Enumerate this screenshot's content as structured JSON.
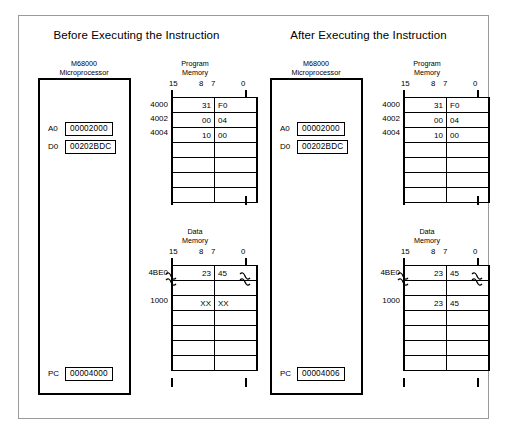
{
  "figure": {
    "bit_header": {
      "msb": "15",
      "bit8": "8",
      "bit7": "7",
      "lsb": "0"
    },
    "cpu_caption_line1": "M68000",
    "cpu_caption_line2": "Microprocessor",
    "program_memory_caption_line1": "Program",
    "program_memory_caption_line2": "Memory",
    "data_memory_caption_line1": "Data",
    "data_memory_caption_line2": "Memory"
  },
  "panels": [
    {
      "title": "Before Executing the Instruction",
      "registers": [
        {
          "name": "A0",
          "value": "00002000"
        },
        {
          "name": "D0",
          "value": "00202BDC"
        }
      ],
      "pc": {
        "name": "PC",
        "value": "00004000"
      },
      "program_memory": {
        "rows": [
          {
            "address": "4000",
            "high": "31",
            "low": "F0"
          },
          {
            "address": "4002",
            "high": "00",
            "low": "04"
          },
          {
            "address": "4004",
            "high": "10",
            "low": "00"
          },
          {
            "address": "",
            "high": "",
            "low": ""
          },
          {
            "address": "",
            "high": "",
            "low": ""
          },
          {
            "address": "",
            "high": "",
            "low": ""
          },
          {
            "address": "",
            "high": "",
            "low": ""
          }
        ]
      },
      "data_memory": {
        "rows": [
          {
            "address": "4BE0",
            "high": "23",
            "low": "45",
            "break_after": true
          },
          {
            "address": "1000",
            "high": "XX",
            "low": "XX",
            "break_after": false
          },
          {
            "address": "",
            "high": "",
            "low": "",
            "break_after": false
          },
          {
            "address": "",
            "high": "",
            "low": "",
            "break_after": false
          },
          {
            "address": "",
            "high": "",
            "low": "",
            "break_after": false
          },
          {
            "address": "",
            "high": "",
            "low": "",
            "break_after": false
          },
          {
            "address": "",
            "high": "",
            "low": "",
            "break_after": false
          }
        ]
      }
    },
    {
      "title": "After Executing the Instruction",
      "registers": [
        {
          "name": "A0",
          "value": "00002000"
        },
        {
          "name": "D0",
          "value": "00202BDC"
        }
      ],
      "pc": {
        "name": "PC",
        "value": "00004006"
      },
      "program_memory": {
        "rows": [
          {
            "address": "4000",
            "high": "31",
            "low": "F0"
          },
          {
            "address": "4002",
            "high": "00",
            "low": "04"
          },
          {
            "address": "4004",
            "high": "10",
            "low": "00"
          },
          {
            "address": "",
            "high": "",
            "low": ""
          },
          {
            "address": "",
            "high": "",
            "low": ""
          },
          {
            "address": "",
            "high": "",
            "low": ""
          },
          {
            "address": "",
            "high": "",
            "low": ""
          }
        ]
      },
      "data_memory": {
        "rows": [
          {
            "address": "4BE0",
            "high": "23",
            "low": "45",
            "break_after": true
          },
          {
            "address": "1000",
            "high": "23",
            "low": "45",
            "break_after": false
          },
          {
            "address": "",
            "high": "",
            "low": "",
            "break_after": false
          },
          {
            "address": "",
            "high": "",
            "low": "",
            "break_after": false
          },
          {
            "address": "",
            "high": "",
            "low": "",
            "break_after": false
          },
          {
            "address": "",
            "high": "",
            "low": "",
            "break_after": false
          },
          {
            "address": "",
            "high": "",
            "low": "",
            "break_after": false
          }
        ]
      }
    }
  ]
}
